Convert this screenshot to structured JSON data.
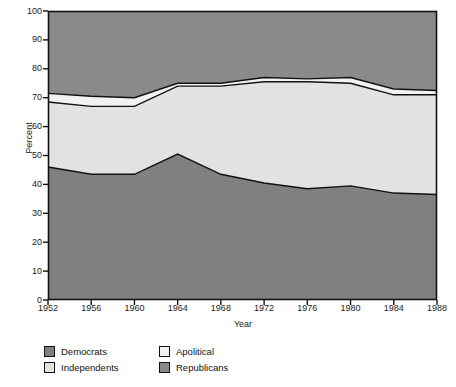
{
  "chart_data": {
    "type": "area",
    "stacked": true,
    "title": "",
    "xlabel": "Year",
    "ylabel": "Percent",
    "categories": [
      1952,
      1956,
      1960,
      1964,
      1968,
      1972,
      1976,
      1980,
      1984,
      1988
    ],
    "xtick_labels": [
      "1952",
      "1956",
      "1960",
      "1964",
      "1968",
      "1972",
      "1976",
      "1980",
      "1984",
      "1988"
    ],
    "ytick_labels": [
      "0",
      "10",
      "20",
      "30",
      "40",
      "50",
      "60",
      "70",
      "80",
      "90",
      "100"
    ],
    "ytick_values": [
      0,
      10,
      20,
      30,
      40,
      50,
      60,
      70,
      80,
      90,
      100
    ],
    "ylim": [
      0,
      100
    ],
    "xlim": [
      1952,
      1988
    ],
    "grid": false,
    "legend_position": "below",
    "series": [
      {
        "name": "Democrats",
        "color": "#808080",
        "values": [
          46.0,
          43.5,
          43.5,
          50.5,
          43.5,
          40.5,
          38.5,
          39.5,
          37.0,
          36.5
        ]
      },
      {
        "name": "Independents",
        "color": "#e2e2e2",
        "values": [
          22.5,
          23.5,
          23.5,
          23.5,
          30.5,
          35.0,
          37.0,
          35.5,
          34.0,
          34.5
        ]
      },
      {
        "name": "Apolitical",
        "color": "#f2f2f2",
        "values": [
          3.0,
          3.5,
          3.0,
          1.0,
          1.0,
          1.5,
          1.0,
          2.0,
          2.0,
          1.5
        ]
      },
      {
        "name": "Republicans",
        "color": "#8a8a8a",
        "values": [
          28.5,
          29.5,
          30.0,
          25.0,
          25.0,
          23.0,
          23.5,
          23.0,
          27.0,
          27.5
        ]
      }
    ],
    "cumulative_boundaries": {
      "democrats_top": [
        46.0,
        43.5,
        43.5,
        50.5,
        43.5,
        40.5,
        38.5,
        39.5,
        37.0,
        36.5
      ],
      "independents_top": [
        68.5,
        67.0,
        67.0,
        74.0,
        74.0,
        75.5,
        75.5,
        75.0,
        71.0,
        71.0
      ],
      "apolitical_top": [
        71.5,
        70.5,
        70.0,
        75.0,
        75.0,
        77.0,
        76.5,
        77.0,
        73.0,
        72.5
      ],
      "republicans_top": [
        100,
        100,
        100,
        100,
        100,
        100,
        100,
        100,
        100,
        100
      ]
    }
  },
  "legend": {
    "items": [
      {
        "label": "Democrats",
        "color": "#808080"
      },
      {
        "label": "Apolitical",
        "color": "#f2f2f2"
      },
      {
        "label": "Independents",
        "color": "#e2e2e2"
      },
      {
        "label": "Republicans",
        "color": "#8a8a8a"
      }
    ]
  },
  "axes": {
    "x_title": "Year",
    "y_title": "Percent"
  },
  "colors": {
    "plot_border": "#111111",
    "band_outline": "#111111",
    "text": "#1a1a1a",
    "background": "#ffffff"
  }
}
